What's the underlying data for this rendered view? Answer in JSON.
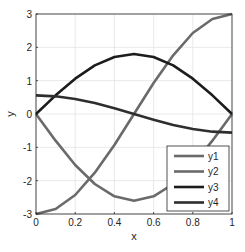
{
  "chart_data": {
    "type": "line",
    "title": "",
    "xlabel": "x",
    "ylabel": "y",
    "xlim": [
      0,
      1
    ],
    "ylim": [
      -3,
      3
    ],
    "grid": true,
    "legend_position": "southeast",
    "x": [
      0,
      0.1,
      0.2,
      0.3,
      0.4,
      0.5,
      0.6,
      0.7,
      0.8,
      0.9,
      1.0
    ],
    "xticks": [
      "0",
      "0.2",
      "0.4",
      "0.6",
      "0.8",
      "1"
    ],
    "yticks": [
      "-3",
      "-2",
      "-1",
      "0",
      "1",
      "2",
      "3"
    ],
    "series": [
      {
        "name": "y1",
        "color": "#6a6a6a",
        "values": [
          -3.0,
          -2.85,
          -2.43,
          -1.76,
          -0.93,
          0.0,
          0.93,
          1.76,
          2.43,
          2.85,
          3.0
        ]
      },
      {
        "name": "y2",
        "color": "#6a6a6a",
        "values": [
          0.0,
          -0.8,
          -1.53,
          -2.1,
          -2.47,
          -2.6,
          -2.47,
          -2.1,
          -1.53,
          -0.8,
          0.0
        ]
      },
      {
        "name": "y3",
        "color": "#1c1c1c",
        "values": [
          0.0,
          0.56,
          1.06,
          1.46,
          1.71,
          1.8,
          1.71,
          1.46,
          1.06,
          0.56,
          0.0
        ]
      },
      {
        "name": "y4",
        "color": "#2e2e2e",
        "values": [
          0.56,
          0.53,
          0.45,
          0.33,
          0.17,
          0.0,
          -0.17,
          -0.33,
          -0.45,
          -0.53,
          -0.56
        ]
      }
    ]
  }
}
